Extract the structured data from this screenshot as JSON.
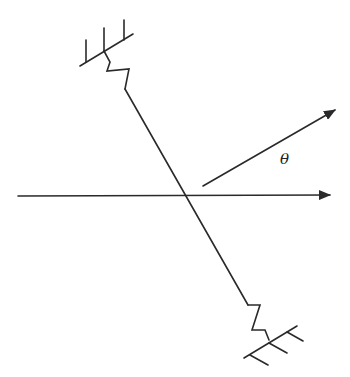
{
  "diagram": {
    "labels": {
      "angle": "θ"
    },
    "colors": {
      "stroke": "#2a2a2a",
      "background": "#ffffff"
    },
    "elements": {
      "top_support": "fixed-wall-hatched",
      "top_spring": "zigzag-spring",
      "rod": "straight-rod",
      "bottom_spring": "zigzag-spring",
      "bottom_support": "fixed-wall-hatched",
      "horizontal_axis": "arrow",
      "direction_vector": "arrow"
    }
  }
}
